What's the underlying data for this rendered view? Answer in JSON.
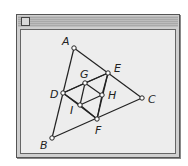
{
  "window": {
    "title": "",
    "close_box": "close-box-icon"
  },
  "diagram": {
    "points": [
      {
        "label": "A",
        "x": 74,
        "y": 48,
        "lx": 62,
        "ly": 45
      },
      {
        "label": "E",
        "x": 108,
        "y": 73,
        "lx": 114,
        "ly": 72
      },
      {
        "label": "C",
        "x": 142,
        "y": 98,
        "lx": 148,
        "ly": 103
      },
      {
        "label": "D",
        "x": 63,
        "y": 93,
        "lx": 50,
        "ly": 98
      },
      {
        "label": "G",
        "x": 85,
        "y": 83,
        "lx": 80,
        "ly": 78
      },
      {
        "label": "H",
        "x": 102,
        "y": 95,
        "lx": 108,
        "ly": 99
      },
      {
        "label": "I",
        "x": 80,
        "y": 105,
        "lx": 70,
        "ly": 114
      },
      {
        "label": "F",
        "x": 97,
        "y": 119,
        "lx": 95,
        "ly": 134
      },
      {
        "label": "B",
        "x": 52,
        "y": 138,
        "lx": 40,
        "ly": 149
      }
    ],
    "segments": [
      [
        "A",
        "B"
      ],
      [
        "A",
        "C"
      ],
      [
        "B",
        "C"
      ],
      [
        "D",
        "E"
      ],
      [
        "E",
        "F"
      ],
      [
        "D",
        "F"
      ],
      [
        "D",
        "G"
      ],
      [
        "G",
        "E"
      ],
      [
        "G",
        "H"
      ],
      [
        "G",
        "I"
      ],
      [
        "H",
        "I"
      ],
      [
        "H",
        "F"
      ],
      [
        "I",
        "F"
      ],
      [
        "D",
        "I"
      ],
      [
        "E",
        "H"
      ]
    ]
  }
}
